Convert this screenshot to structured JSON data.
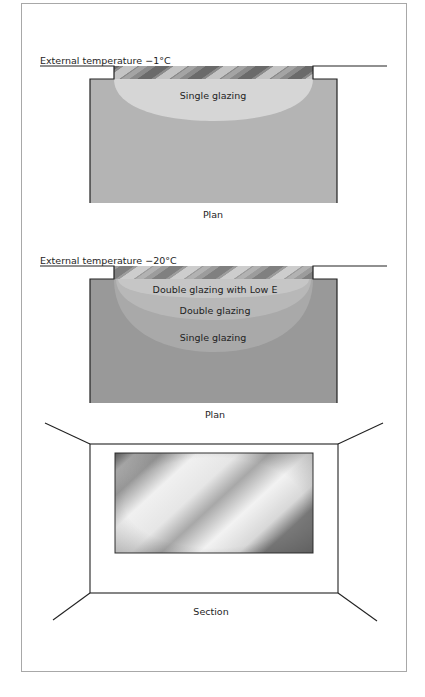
{
  "plan1": {
    "external_label": "External temperature −1°C",
    "zones": [
      "Single glazing"
    ],
    "caption": "Plan",
    "room_color": "#b4b4b4",
    "zone_color": "#d6d6d6"
  },
  "plan2": {
    "external_label": "External temperature −20°C",
    "zones": [
      "Double glazing with Low E",
      "Double glazing",
      "Single glazing"
    ],
    "caption": "Plan",
    "room_color": "#999999",
    "zone_colors": [
      "#c4c4c4",
      "#b6b6b6",
      "#a8a8a8"
    ]
  },
  "section": {
    "caption": "Section"
  }
}
